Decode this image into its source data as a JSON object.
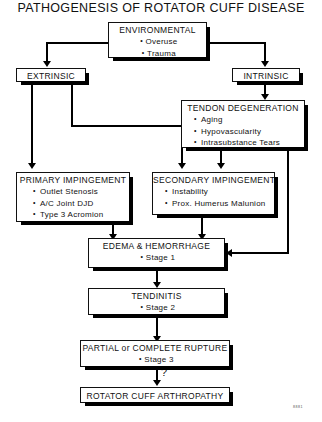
{
  "title": "PATHOGENESIS OF ROTATOR CUFF DISEASE",
  "corner_code": "8881",
  "junction_label": "?",
  "nodes": {
    "environmental": {
      "heading": "ENVIRONMENTAL",
      "items": [
        "Overuse",
        "Trauma"
      ]
    },
    "extrinsic": {
      "heading": "EXTRINSIC",
      "items": []
    },
    "intrinsic": {
      "heading": "INTRINSIC",
      "items": []
    },
    "tendon_degeneration": {
      "heading": "TENDON DEGENERATION",
      "items": [
        "Aging",
        "Hypovascularity",
        "Intrasubstance Tears"
      ]
    },
    "primary_impingement": {
      "heading": "PRIMARY IMPINGEMENT",
      "items": [
        "Outlet Stenosis",
        "A/C Joint DJD",
        "Type 3 Acromion"
      ]
    },
    "secondary_impingement": {
      "heading": "SECONDARY IMPINGEMENT",
      "items": [
        "Instability",
        "Prox. Humerus Malunion"
      ]
    },
    "edema_hemorrhage": {
      "heading": "EDEMA & HEMORRHAGE",
      "items": [
        "Stage 1"
      ]
    },
    "tendinitis": {
      "heading": "TENDINITIS",
      "items": [
        "Stage 2"
      ]
    },
    "rupture": {
      "heading": "PARTIAL or COMPLETE RUPTURE",
      "items": [
        "Stage 3"
      ]
    },
    "arthropathy": {
      "heading": "ROTATOR CUFF ARTHROPATHY",
      "items": []
    }
  },
  "colors": {
    "ink": "#111111",
    "shadow": "#000000",
    "paper": "#ffffff"
  }
}
